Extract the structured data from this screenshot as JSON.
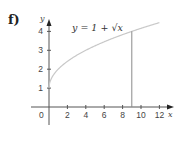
{
  "part_label": "f)",
  "chart_data": {
    "type": "line",
    "title": "",
    "equation_label": "y = 1 + √x",
    "xlabel": "x",
    "ylabel": "y",
    "origin_label": "0",
    "x_ticks": [
      2,
      4,
      6,
      8,
      10,
      12
    ],
    "x_tick_labels": [
      "2",
      "4",
      "6",
      "8",
      "10",
      "12"
    ],
    "y_ticks": [
      1,
      2,
      3,
      4
    ],
    "y_tick_labels": [
      "1",
      "2",
      "3",
      "4"
    ],
    "xlim": [
      0,
      13
    ],
    "ylim": [
      -0.8,
      4.6
    ],
    "grid": false,
    "series": [
      {
        "name": "y = 1 + √x",
        "function": "1 + sqrt(x)",
        "x": [
          0,
          0.25,
          1,
          2,
          3,
          4,
          5,
          6,
          7,
          8,
          9,
          10,
          11,
          12
        ],
        "y": [
          1,
          1.5,
          2,
          2.41,
          2.73,
          3,
          3.24,
          3.45,
          3.65,
          3.83,
          4,
          4.16,
          4.32,
          4.46
        ],
        "color": "#c8c8c8"
      }
    ],
    "annotations": [
      {
        "type": "vertical_line",
        "x": 9,
        "y_from": 0,
        "y_to": 4,
        "color": "#8a8a8a"
      }
    ]
  }
}
